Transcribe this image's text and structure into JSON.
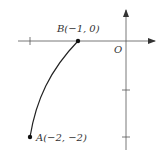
{
  "diagram": {
    "origin_label": "O",
    "point_a": {
      "label": "A(−2, −2)",
      "x": -2,
      "y": -2
    },
    "point_b": {
      "label": "B(−1, 0)",
      "x": -1,
      "y": 0
    },
    "colors": {
      "axis": "#555555",
      "curve": "#222222",
      "point": "#111111",
      "text": "#333333"
    }
  }
}
